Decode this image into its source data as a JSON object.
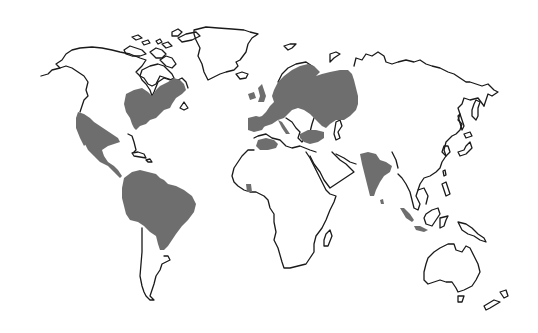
{
  "map": {
    "type": "world-outline-map",
    "projection": "equirectangular-like",
    "background_color": "#ffffff",
    "outline_color": "#1a1a1a",
    "highlight_color": "#6e6e6e",
    "legend": null,
    "title": null,
    "highlighted_regions": [
      {
        "id": "eastern-north-america",
        "label": "Eastern North America"
      },
      {
        "id": "mexico-central-america",
        "label": "Mexico and Central America"
      },
      {
        "id": "northern-south-america",
        "label": "Northern South America / Brazil"
      },
      {
        "id": "europe-western-russia",
        "label": "Europe and Western Russia"
      },
      {
        "id": "anatolia",
        "label": "Anatolia"
      },
      {
        "id": "north-africa",
        "label": "North Africa"
      },
      {
        "id": "west-africa",
        "label": "West Africa (small area)"
      },
      {
        "id": "india",
        "label": "Indian Subcontinent"
      },
      {
        "id": "sumatra-java",
        "label": "Sumatra and Java"
      }
    ],
    "outlined_landmasses": [
      "North America",
      "Greenland",
      "Canadian Arctic Archipelago",
      "South America",
      "Africa",
      "Madagascar",
      "Asia",
      "Arabian Peninsula",
      "Japan",
      "Southeast Asia islands",
      "New Guinea",
      "Australia",
      "Tasmania",
      "New Zealand"
    ]
  }
}
